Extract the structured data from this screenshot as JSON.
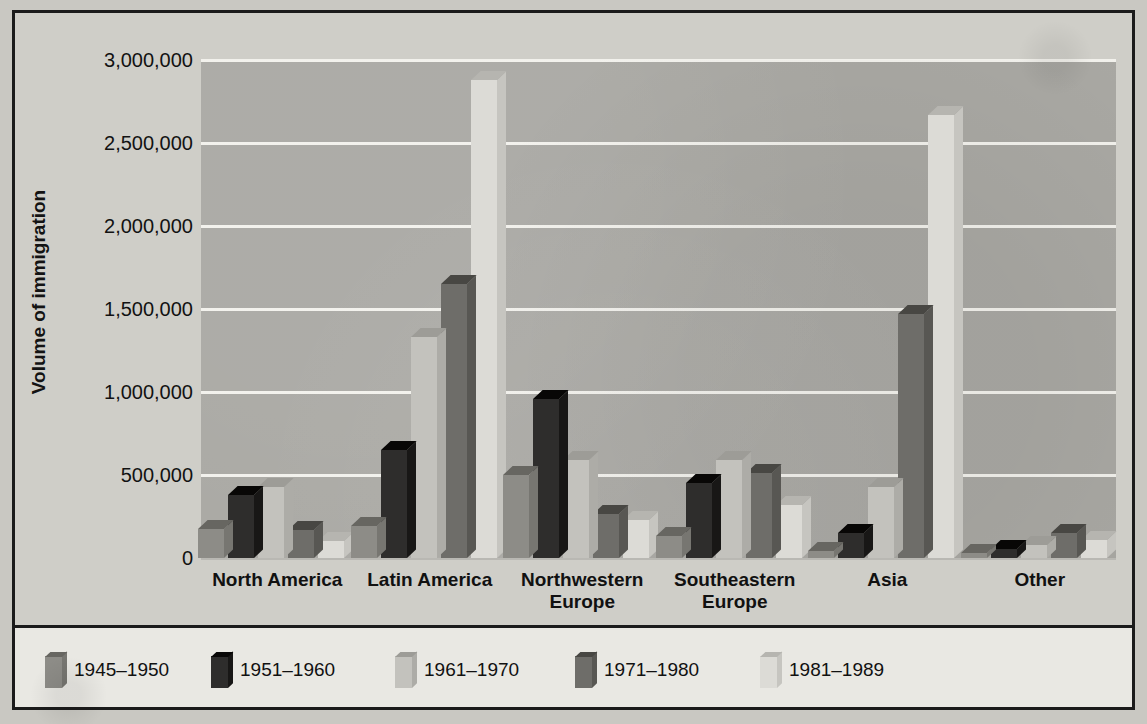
{
  "chart_data": {
    "type": "bar",
    "title": "",
    "xlabel": "",
    "ylabel": "Volume of immigration",
    "ylim": [
      0,
      3000000
    ],
    "grid": true,
    "legend_position": "bottom",
    "categories": [
      "North America",
      "Latin America",
      "Northwestern Europe",
      "Southeastern Europe",
      "Asia",
      "Other"
    ],
    "y_ticks": [
      0,
      500000,
      1000000,
      1500000,
      2000000,
      2500000,
      3000000
    ],
    "y_tick_labels": [
      "0",
      "500,000",
      "1,000,000",
      "1,500,000",
      "2,000,000",
      "2,500,000",
      "3,000,000"
    ],
    "series": [
      {
        "name": "1945–1950",
        "color": "#8d8c87",
        "values": [
          172000,
          190000,
          500000,
          130000,
          42000,
          30000
        ]
      },
      {
        "name": "1951–1960",
        "color": "#2e2d2c",
        "values": [
          378000,
          650000,
          960000,
          450000,
          150000,
          52000
        ]
      },
      {
        "name": "1961–1970",
        "color": "#c3c2bd",
        "values": [
          430000,
          1330000,
          590000,
          590000,
          430000,
          78000
        ]
      },
      {
        "name": "1971–1980",
        "color": "#6e6d69",
        "values": [
          170000,
          1650000,
          265000,
          510000,
          1470000,
          148000
        ]
      },
      {
        "name": "1981–1989",
        "color": "#dcdbd6",
        "values": [
          100000,
          2880000,
          230000,
          320000,
          2670000,
          110000
        ]
      }
    ]
  },
  "axis": {
    "y_title": "Volume of immigration"
  },
  "legend": {
    "entries": [
      {
        "label": "1945–1950"
      },
      {
        "label": "1951–1960"
      },
      {
        "label": "1961–1970"
      },
      {
        "label": "1971–1980"
      },
      {
        "label": "1981–1989"
      }
    ]
  }
}
